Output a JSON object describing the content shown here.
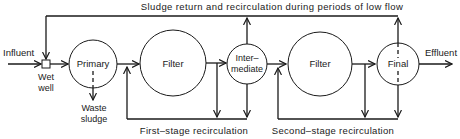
{
  "diagram": {
    "type": "process-flow",
    "title_label": "Sludge return and recirculation during periods of low flow",
    "influent_label": "Influent",
    "effluent_label": "Effluent",
    "nodes": {
      "wet_well": {
        "line1": "Wet",
        "line2": "well"
      },
      "primary": {
        "label": "Primary"
      },
      "filter1": {
        "label": "Filter"
      },
      "intermediate": {
        "line1": "Inter–",
        "line2": "mediate"
      },
      "filter2": {
        "label": "Filter"
      },
      "final": {
        "label": "Final"
      }
    },
    "waste_sludge": {
      "line1": "Waste",
      "line2": "sludge"
    },
    "first_stage_label": "First–stage recirculation",
    "second_stage_label": "Second–stage recirculation",
    "edges": [
      [
        "Influent",
        "Wet well"
      ],
      [
        "Wet well",
        "Primary"
      ],
      [
        "Primary",
        "Filter"
      ],
      [
        "Filter",
        "Intermediate"
      ],
      [
        "Intermediate",
        "Filter"
      ],
      [
        "Filter",
        "Final"
      ],
      [
        "Final",
        "Effluent"
      ],
      [
        "Primary",
        "Waste sludge"
      ],
      [
        "Intermediate",
        "Wet well (sludge return)"
      ],
      [
        "Final",
        "Wet well (sludge return)"
      ],
      [
        "Filter outlet / Intermediate",
        "Filter inlet (first-stage recirculation)"
      ],
      [
        "Filter outlet / Final",
        "Filter inlet (second-stage recirculation)"
      ]
    ],
    "colors": {
      "line": "#1a1a1a",
      "background": "#ffffff"
    }
  }
}
